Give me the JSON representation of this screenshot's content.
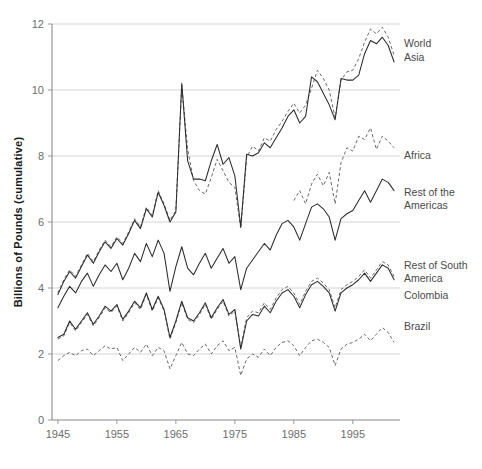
{
  "chart_data": {
    "type": "line",
    "title": "",
    "xlabel": "",
    "ylabel": "Billions of Pounds (cumulative)",
    "xlim": [
      1944,
      2003
    ],
    "ylim": [
      0,
      12
    ],
    "grid": true,
    "legend_position": "right-inline",
    "x_ticks": [
      "1945",
      "1955",
      "1965",
      "1975",
      "1985",
      "1995"
    ],
    "x_tick_values": [
      1945,
      1955,
      1965,
      1975,
      1985,
      1995
    ],
    "y_ticks": [
      "0",
      "2",
      "4",
      "6",
      "8",
      "10",
      "12"
    ],
    "y_tick_values": [
      0,
      2,
      4,
      6,
      8,
      10,
      12
    ],
    "x": [
      1945,
      1946,
      1947,
      1948,
      1949,
      1950,
      1951,
      1952,
      1953,
      1954,
      1955,
      1956,
      1957,
      1958,
      1959,
      1960,
      1961,
      1962,
      1963,
      1964,
      1965,
      1966,
      1967,
      1968,
      1969,
      1970,
      1971,
      1972,
      1973,
      1974,
      1975,
      1976,
      1977,
      1978,
      1979,
      1980,
      1981,
      1982,
      1983,
      1984,
      1985,
      1986,
      1987,
      1988,
      1989,
      1990,
      1991,
      1992,
      1993,
      1994,
      1995,
      1996,
      1997,
      1998,
      1999,
      2000,
      2001,
      2002
    ],
    "series": [
      {
        "name": "World",
        "style": "dashed",
        "color": "#6a6a6a",
        "label_x": 2003,
        "label_y": 11.55,
        "values": [
          3.85,
          4.25,
          4.55,
          4.35,
          4.7,
          5.05,
          4.8,
          5.15,
          5.45,
          5.25,
          5.55,
          5.35,
          5.7,
          6.1,
          5.85,
          6.45,
          6.2,
          6.95,
          6.55,
          6.05,
          6.35,
          10.15,
          8.2,
          7.25,
          6.95,
          6.85,
          7.35,
          7.9,
          7.55,
          7.2,
          7.05,
          5.8,
          7.95,
          8.3,
          8.15,
          8.55,
          8.45,
          8.8,
          9.05,
          9.35,
          9.6,
          9.3,
          9.55,
          10.05,
          10.6,
          10.35,
          10.0,
          9.15,
          10.3,
          10.55,
          10.6,
          10.95,
          11.45,
          11.85,
          11.7,
          11.9,
          11.6,
          11.05
        ]
      },
      {
        "name": "Asia",
        "style": "solid",
        "color": "#2b2b2b",
        "label_x": 2003,
        "label_y": 10.75,
        "values": [
          3.8,
          4.2,
          4.5,
          4.3,
          4.65,
          5.0,
          4.75,
          5.1,
          5.4,
          5.2,
          5.5,
          5.3,
          5.65,
          6.05,
          5.8,
          6.4,
          6.15,
          6.9,
          6.5,
          6.0,
          6.3,
          10.2,
          7.85,
          7.3,
          7.3,
          7.25,
          7.85,
          8.35,
          7.75,
          7.95,
          7.4,
          5.85,
          8.05,
          8.0,
          8.1,
          8.4,
          8.25,
          8.55,
          8.85,
          9.2,
          9.4,
          9.0,
          9.2,
          10.4,
          10.25,
          9.9,
          9.55,
          9.1,
          10.35,
          10.3,
          10.3,
          10.45,
          11.1,
          11.5,
          11.4,
          11.6,
          11.35,
          10.85
        ]
      },
      {
        "name": "Africa",
        "style": "dashed",
        "color": "#6a6a6a",
        "label_x": 2003,
        "label_y": 8.15,
        "values": [
          null,
          null,
          null,
          null,
          null,
          null,
          null,
          null,
          null,
          null,
          null,
          null,
          null,
          null,
          null,
          null,
          null,
          null,
          null,
          null,
          null,
          null,
          null,
          null,
          null,
          null,
          null,
          null,
          null,
          null,
          null,
          null,
          null,
          null,
          null,
          null,
          null,
          null,
          null,
          null,
          6.65,
          6.95,
          6.55,
          7.15,
          7.45,
          7.1,
          7.5,
          6.55,
          7.8,
          8.25,
          8.15,
          8.6,
          8.5,
          8.85,
          8.2,
          8.6,
          8.45,
          8.25
        ]
      },
      {
        "name": "Rest of the Americas",
        "style": "solid",
        "color": "#2b2b2b",
        "label_x": 2003,
        "label_y": 6.7,
        "values": [
          3.4,
          3.75,
          4.05,
          3.85,
          4.2,
          4.45,
          4.05,
          4.4,
          4.7,
          4.5,
          4.75,
          4.25,
          4.6,
          5.05,
          4.8,
          5.35,
          4.95,
          5.45,
          5.05,
          3.9,
          4.65,
          5.25,
          4.6,
          4.4,
          4.75,
          5.05,
          4.6,
          4.9,
          5.2,
          4.75,
          4.95,
          3.95,
          4.6,
          4.85,
          5.1,
          5.35,
          5.15,
          5.6,
          5.95,
          6.05,
          5.85,
          5.45,
          5.95,
          6.45,
          6.55,
          6.4,
          6.15,
          5.45,
          6.1,
          6.25,
          6.35,
          6.65,
          6.95,
          6.6,
          6.95,
          7.3,
          7.2,
          6.95
        ]
      },
      {
        "name": "Rest of South America",
        "style": "dashed",
        "color": "#6a6a6a",
        "label_x": 2003,
        "label_y": 4.85,
        "values": [
          2.45,
          2.55,
          2.95,
          2.7,
          2.95,
          3.2,
          2.85,
          3.1,
          3.4,
          3.25,
          3.45,
          3.0,
          3.25,
          3.55,
          3.35,
          3.8,
          3.3,
          3.7,
          3.3,
          2.45,
          2.95,
          3.55,
          3.05,
          2.95,
          3.2,
          3.5,
          3.05,
          3.35,
          3.6,
          3.15,
          3.3,
          2.2,
          3.1,
          3.3,
          3.25,
          3.55,
          3.35,
          3.7,
          3.95,
          4.05,
          3.85,
          3.5,
          3.9,
          4.2,
          4.3,
          4.15,
          3.95,
          3.4,
          3.95,
          4.1,
          4.2,
          4.35,
          4.55,
          4.3,
          4.55,
          4.8,
          4.7,
          4.35
        ]
      },
      {
        "name": "Colombia",
        "style": "solid",
        "color": "#2b2b2b",
        "label_x": 2003,
        "label_y": 4.15,
        "values": [
          2.5,
          2.6,
          3.0,
          2.75,
          3.0,
          3.25,
          2.9,
          3.15,
          3.45,
          3.3,
          3.5,
          3.05,
          3.3,
          3.6,
          3.4,
          3.85,
          3.35,
          3.75,
          3.35,
          2.5,
          3.0,
          3.6,
          3.1,
          3.0,
          3.25,
          3.55,
          3.1,
          3.4,
          3.65,
          3.2,
          3.35,
          2.15,
          3.0,
          3.2,
          3.15,
          3.45,
          3.25,
          3.6,
          3.85,
          3.95,
          3.75,
          3.4,
          3.8,
          4.1,
          4.2,
          4.05,
          3.85,
          3.3,
          3.85,
          4.0,
          4.1,
          4.25,
          4.45,
          4.2,
          4.45,
          4.7,
          4.6,
          4.25
        ]
      },
      {
        "name": "Brazil",
        "style": "dashed",
        "color": "#6a6a6a",
        "label_x": 2003,
        "label_y": 3.05,
        "values": [
          1.8,
          1.95,
          2.05,
          1.95,
          2.1,
          2.15,
          1.95,
          2.1,
          2.25,
          2.15,
          2.2,
          1.8,
          2.0,
          2.2,
          2.05,
          2.3,
          1.95,
          2.2,
          2.1,
          1.55,
          1.95,
          2.35,
          2.0,
          1.95,
          2.15,
          2.3,
          2.0,
          2.25,
          2.4,
          2.1,
          2.2,
          1.35,
          1.85,
          2.0,
          1.9,
          2.15,
          1.95,
          2.2,
          2.35,
          2.4,
          2.25,
          1.95,
          2.2,
          2.4,
          2.45,
          2.35,
          2.2,
          1.65,
          2.15,
          2.3,
          2.35,
          2.45,
          2.6,
          2.4,
          2.6,
          2.8,
          2.65,
          2.35
        ]
      }
    ]
  },
  "axis": {
    "y_title": "Billions of Pounds (cumulative)"
  },
  "labels": {
    "world": "World",
    "asia": "Asia",
    "africa": "Africa",
    "rest_of_the_americas_line1": "Rest of the",
    "rest_of_the_americas_line2": "Americas",
    "rest_of_south_america_line1": "Rest of South",
    "rest_of_south_america_line2": "America",
    "colombia": "Colombia",
    "brazil": "Brazil"
  }
}
